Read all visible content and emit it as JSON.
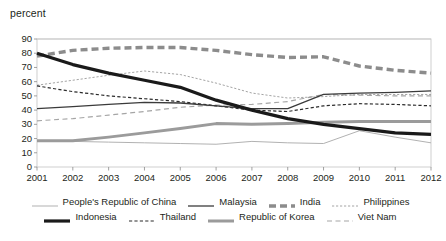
{
  "chart_data": {
    "type": "line",
    "title": "",
    "unit_label": "percent",
    "xlabel": "",
    "ylabel": "percent",
    "x": [
      2001,
      2002,
      2003,
      2004,
      2005,
      2006,
      2007,
      2008,
      2009,
      2010,
      2011,
      2012
    ],
    "categories": [
      "2001",
      "2002",
      "2003",
      "2004",
      "2005",
      "2006",
      "2007",
      "2008",
      "2009",
      "2010",
      "2011",
      "2012"
    ],
    "ylim": [
      0,
      90
    ],
    "yticks": [
      0,
      10,
      20,
      30,
      40,
      50,
      60,
      70,
      80,
      90
    ],
    "grid": true,
    "legend_position": "bottom",
    "series": [
      {
        "name": "People's Republic of China",
        "style": "solid-thin",
        "color": "#a8a8a8",
        "values": [
          18,
          18,
          17.5,
          17,
          16.5,
          16,
          18,
          17,
          16.5,
          25.5,
          21,
          17
        ]
      },
      {
        "name": "Malaysia",
        "style": "solid-thin-dark",
        "color": "#3b3b3b",
        "values": [
          41,
          42.5,
          44,
          45.5,
          45,
          43,
          41,
          41,
          51,
          52,
          52.5,
          53.5
        ]
      },
      {
        "name": "India",
        "style": "dashed-thick",
        "color": "#8c8c8c",
        "values": [
          78,
          82,
          83.5,
          84,
          84,
          82,
          79,
          77,
          77.5,
          71,
          68,
          66
        ]
      },
      {
        "name": "Philippines",
        "style": "dotted-thin",
        "color": "#9a9a9a",
        "values": [
          57.5,
          61,
          64.5,
          67.5,
          65,
          59,
          52,
          48.5,
          49.5,
          51,
          51,
          51
        ]
      },
      {
        "name": "Indonesia",
        "style": "solid-thick-black",
        "color": "#1a1a1a",
        "values": [
          80,
          72,
          66,
          61,
          56,
          47,
          40,
          34,
          30,
          27,
          24,
          23
        ]
      },
      {
        "name": "Thailand",
        "style": "dashed-thin-dark",
        "color": "#2b2b2b",
        "values": [
          57,
          53,
          50,
          48,
          46,
          43,
          40,
          39,
          43,
          44.5,
          44,
          43
        ]
      },
      {
        "name": "Republic of Korea",
        "style": "solid-thick-gray",
        "color": "#9b9b9b",
        "values": [
          18.5,
          18.5,
          21,
          24,
          27,
          30.5,
          30,
          30.5,
          31.5,
          32,
          32,
          32
        ]
      },
      {
        "name": "Viet Nam",
        "style": "dashed-gray",
        "color": "#a5a5a5",
        "values": [
          32.5,
          34,
          36.5,
          39,
          42,
          43.5,
          44,
          46,
          51,
          50.5,
          50,
          50
        ]
      }
    ]
  },
  "legend": {
    "row1": [
      {
        "label": "People's Republic of China",
        "style": "solid-thin",
        "color": "#a8a8a8"
      },
      {
        "label": "Malaysia",
        "style": "solid-thin-dark",
        "color": "#3b3b3b"
      },
      {
        "label": "India",
        "style": "dashed-thick",
        "color": "#8c8c8c"
      },
      {
        "label": "Philippines",
        "style": "dotted-thin",
        "color": "#9a9a9a"
      }
    ],
    "row2": [
      {
        "label": "Indonesia",
        "style": "solid-thick-black",
        "color": "#1a1a1a"
      },
      {
        "label": "Thailand",
        "style": "dashed-thin-dark",
        "color": "#2b2b2b"
      },
      {
        "label": "Republic of Korea",
        "style": "solid-thick-gray",
        "color": "#9b9b9b"
      },
      {
        "label": "Viet Nam",
        "style": "dashed-gray",
        "color": "#a5a5a5"
      }
    ]
  },
  "axes": {
    "y_labels": [
      "90",
      "80",
      "70",
      "60",
      "50",
      "40",
      "30",
      "20",
      "10",
      "0"
    ],
    "x_labels": [
      "2001",
      "2002",
      "2003",
      "2004",
      "2005",
      "2006",
      "2007",
      "2008",
      "2009",
      "2010",
      "2011",
      "2012"
    ]
  }
}
